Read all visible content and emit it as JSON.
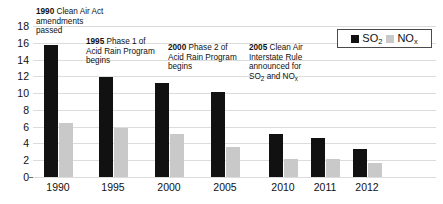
{
  "chart_data": {
    "type": "bar",
    "title": "",
    "xlabel": "",
    "ylabel": "",
    "ylim": [
      0,
      18
    ],
    "ytick_step": 2,
    "grid": true,
    "legend_position": "top-right",
    "categories": [
      "1990",
      "1995",
      "2000",
      "2005",
      "2010",
      "2011",
      "2012"
    ],
    "yticks": [
      "18",
      "16",
      "14",
      "12",
      "10",
      "8",
      "6",
      "4",
      "2",
      "0"
    ],
    "series": [
      {
        "name": "SO2",
        "label_main": "SO",
        "label_sub": "2",
        "color": "#111111",
        "values": [
          15.7,
          11.9,
          11.2,
          10.1,
          5.1,
          4.6,
          3.3
        ]
      },
      {
        "name": "NOx",
        "label_main": "NO",
        "label_sub": "x",
        "color": "#c9c9c9",
        "values": [
          6.4,
          5.9,
          5.1,
          3.6,
          2.2,
          2.1,
          1.7
        ]
      }
    ],
    "annotations": [
      {
        "year": "1990",
        "text": " Clean Air Act amendments passed",
        "line1_year": "1990",
        "line1_rest": " Clean Air Act",
        "line2": "amendments",
        "line3": "passed",
        "line4": "",
        "has_subscripts": false
      },
      {
        "year": "1995",
        "text": " Phase 1 of Acid Rain Program begins",
        "line1_year": "1995",
        "line1_rest": " Phase 1 of",
        "line2": "Acid Rain Program",
        "line3": "begins",
        "line4": "",
        "has_subscripts": false
      },
      {
        "year": "2000",
        "text": " Phase 2 of Acid Rain Program begins",
        "line1_year": "2000",
        "line1_rest": " Phase 2 of",
        "line2": "Acid Rain Program",
        "line3": "begins",
        "line4": "",
        "has_subscripts": false
      },
      {
        "year": "2005",
        "text": " Clean Air Interstate Rule announced for SO2 and NOx",
        "line1_year": "2005",
        "line1_rest": " Clean Air",
        "line2": "Interstate Rule",
        "line3": "announced for",
        "line4": "SO2 and NOx",
        "has_subscripts": true
      }
    ]
  }
}
